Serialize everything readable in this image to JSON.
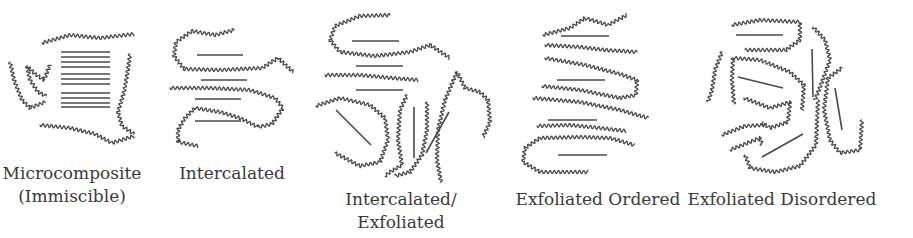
{
  "figure": {
    "colors": {
      "ink": "#4a4a4a",
      "text": "#3a3a3a",
      "background": "#ffffff"
    },
    "panels": [
      {
        "id": "microcomposite",
        "label_lines": [
          "Microcomposite",
          "(Immiscible)"
        ],
        "label_x": 72,
        "label_y": 162,
        "plates": [
          [
            61,
            52,
            110,
            52
          ],
          [
            61,
            57,
            110,
            57
          ],
          [
            61,
            62,
            110,
            62
          ],
          [
            61,
            67,
            110,
            67
          ],
          [
            61,
            74,
            110,
            74
          ],
          [
            61,
            79,
            110,
            79
          ],
          [
            61,
            84,
            110,
            84
          ],
          [
            61,
            93,
            110,
            93
          ],
          [
            61,
            98,
            110,
            98
          ],
          [
            61,
            103,
            110,
            103
          ],
          [
            61,
            107,
            110,
            107
          ]
        ],
        "chains": [
          [
            [
              42,
              43
            ],
            [
              70,
              35
            ],
            [
              100,
              38
            ],
            [
              134,
              34
            ]
          ],
          [
            [
              10,
              62
            ],
            [
              14,
              80
            ],
            [
              22,
              100
            ],
            [
              30,
              108
            ],
            [
              45,
              102
            ]
          ],
          [
            [
              27,
              66
            ],
            [
              30,
              80
            ],
            [
              38,
              92
            ],
            [
              46,
              96
            ]
          ],
          [
            [
              27,
              66
            ],
            [
              35,
              74
            ],
            [
              44,
              80
            ],
            [
              50,
              65
            ]
          ],
          [
            [
              130,
              54
            ],
            [
              128,
              70
            ],
            [
              124,
              92
            ],
            [
              118,
              112
            ],
            [
              122,
              126
            ],
            [
              134,
              134
            ]
          ],
          [
            [
              40,
              125
            ],
            [
              70,
              128
            ],
            [
              95,
              134
            ],
            [
              112,
              143
            ],
            [
              134,
              136
            ]
          ]
        ]
      },
      {
        "id": "intercalated",
        "label_lines": [
          "Intercalated"
        ],
        "label_x": 232,
        "label_y": 162,
        "plates": [
          [
            197,
            55,
            243,
            55
          ],
          [
            201,
            80,
            247,
            80
          ],
          [
            195,
            99,
            241,
            99
          ],
          [
            195,
            121,
            241,
            121
          ]
        ],
        "chains": [
          [
            [
              234,
              30
            ],
            [
              215,
              35
            ],
            [
              192,
              31
            ],
            [
              176,
              42
            ],
            [
              174,
              56
            ],
            [
              184,
              69
            ],
            [
              220,
              70
            ],
            [
              262,
              68
            ],
            [
              278,
              58
            ],
            [
              293,
              72
            ]
          ],
          [
            [
              170,
              88
            ],
            [
              210,
              88
            ],
            [
              250,
              90
            ],
            [
              275,
              98
            ],
            [
              283,
              108
            ],
            [
              272,
              124
            ],
            [
              258,
              127
            ]
          ],
          [
            [
              258,
              127
            ],
            [
              240,
              118
            ],
            [
              220,
              112
            ],
            [
              195,
              108
            ],
            [
              185,
              118
            ],
            [
              178,
              130
            ],
            [
              178,
              142
            ],
            [
              198,
              146
            ]
          ]
        ]
      },
      {
        "id": "intercalated-exfoliated",
        "label_lines": [
          "Intercalated/",
          "Exfoliated"
        ],
        "label_x": 401,
        "label_y": 188,
        "plates": [
          [
            352,
            41,
            399,
            41
          ],
          [
            356,
            66,
            403,
            66
          ],
          [
            356,
            90,
            403,
            90
          ],
          [
            336,
            110,
            371,
            145
          ],
          [
            414,
            107,
            414,
            158
          ],
          [
            449,
            112,
            426,
            153
          ]
        ],
        "chains": [
          [
            [
              390,
              15
            ],
            [
              360,
              16
            ],
            [
              335,
              26
            ],
            [
              330,
              40
            ],
            [
              340,
              52
            ],
            [
              375,
              56
            ],
            [
              410,
              52
            ],
            [
              430,
              45
            ],
            [
              450,
              58
            ]
          ],
          [
            [
              325,
              75
            ],
            [
              360,
              75
            ],
            [
              392,
              78
            ],
            [
              418,
              80
            ]
          ],
          [
            [
              316,
              106
            ],
            [
              340,
              98
            ],
            [
              370,
              105
            ],
            [
              385,
              118
            ],
            [
              388,
              140
            ],
            [
              380,
              162
            ],
            [
              360,
              166
            ],
            [
              335,
              153
            ]
          ],
          [
            [
              407,
              95
            ],
            [
              400,
              110
            ],
            [
              398,
              140
            ],
            [
              402,
              165
            ],
            [
              390,
              172
            ],
            [
              385,
              176
            ]
          ],
          [
            [
              427,
              102
            ],
            [
              427,
              130
            ],
            [
              422,
              155
            ],
            [
              410,
              172
            ],
            [
              395,
              176
            ]
          ],
          [
            [
              457,
              72
            ],
            [
              445,
              100
            ],
            [
              438,
              130
            ],
            [
              437,
              160
            ],
            [
              441,
              182
            ]
          ],
          [
            [
              457,
              72
            ],
            [
              465,
              88
            ],
            [
              480,
              92
            ],
            [
              488,
              100
            ],
            [
              490,
              122
            ],
            [
              483,
              137
            ]
          ]
        ]
      },
      {
        "id": "exfoliated-ordered",
        "label_lines": [
          "Exfoliated Ordered"
        ],
        "label_x": 598,
        "label_y": 188,
        "plates": [
          [
            561,
            36,
            609,
            36
          ],
          [
            557,
            80,
            605,
            80
          ],
          [
            548,
            120,
            597,
            120
          ],
          [
            558,
            155,
            607,
            155
          ]
        ],
        "chains": [
          [
            [
              543,
              35
            ],
            [
              570,
              28
            ],
            [
              585,
              18
            ],
            [
              608,
              25
            ],
            [
              627,
              15
            ]
          ],
          [
            [
              545,
              45
            ],
            [
              580,
              47
            ],
            [
              605,
              50
            ],
            [
              637,
              52
            ]
          ],
          [
            [
              545,
              58
            ],
            [
              585,
              65
            ],
            [
              620,
              74
            ],
            [
              637,
              80
            ],
            [
              636,
              95
            ],
            [
              620,
              98
            ]
          ],
          [
            [
              542,
              86
            ],
            [
              580,
              90
            ],
            [
              620,
              98
            ]
          ],
          [
            [
              533,
              98
            ],
            [
              580,
              102
            ],
            [
              620,
              110
            ],
            [
              648,
              118
            ]
          ],
          [
            [
              537,
              126
            ],
            [
              570,
              125
            ],
            [
              600,
              128
            ],
            [
              626,
              131
            ]
          ],
          [
            [
              540,
              138
            ],
            [
              580,
              137
            ],
            [
              610,
              138
            ],
            [
              634,
              145
            ]
          ],
          [
            [
              540,
              138
            ],
            [
              525,
              148
            ],
            [
              523,
              162
            ],
            [
              540,
              172
            ],
            [
              588,
              172
            ]
          ]
        ]
      },
      {
        "id": "exfoliated-disordered",
        "label_lines": [
          "Exfoliated Disordered"
        ],
        "label_x": 782,
        "label_y": 188,
        "plates": [
          [
            736,
            35,
            783,
            35
          ],
          [
            738,
            77,
            783,
            88
          ],
          [
            812,
            49,
            813,
            97
          ],
          [
            835,
            88,
            842,
            130
          ],
          [
            762,
            157,
            803,
            134
          ]
        ],
        "chains": [
          [
            [
              732,
              25
            ],
            [
              760,
              20
            ],
            [
              800,
              22
            ],
            [
              800,
              40
            ],
            [
              786,
              50
            ],
            [
              745,
              50
            ]
          ],
          [
            [
              722,
              52
            ],
            [
              715,
              70
            ],
            [
              712,
              90
            ],
            [
              708,
              102
            ]
          ],
          [
            [
              733,
              58
            ],
            [
              760,
              60
            ],
            [
              790,
              72
            ],
            [
              804,
              85
            ],
            [
              802,
              110
            ]
          ],
          [
            [
              733,
              58
            ],
            [
              732,
              80
            ],
            [
              734,
              104
            ]
          ],
          [
            [
              744,
              98
            ],
            [
              770,
              108
            ],
            [
              790,
              102
            ],
            [
              788,
              122
            ],
            [
              770,
              128
            ],
            [
              762,
              123
            ]
          ],
          [
            [
              722,
              135
            ],
            [
              745,
              126
            ],
            [
              765,
              125
            ]
          ],
          [
            [
              730,
              150
            ],
            [
              760,
              138
            ],
            [
              762,
              145
            ]
          ],
          [
            [
              745,
              155
            ],
            [
              750,
              168
            ],
            [
              775,
              172
            ],
            [
              800,
              166
            ],
            [
              816,
              145
            ],
            [
              818,
              100
            ]
          ],
          [
            [
              813,
              27
            ],
            [
              825,
              40
            ],
            [
              830,
              60
            ],
            [
              822,
              82
            ],
            [
              815,
              100
            ]
          ],
          [
            [
              842,
              68
            ],
            [
              828,
              78
            ],
            [
              824,
              110
            ],
            [
              830,
              140
            ],
            [
              840,
              153
            ],
            [
              860,
              150
            ],
            [
              862,
              120
            ]
          ]
        ]
      }
    ]
  }
}
